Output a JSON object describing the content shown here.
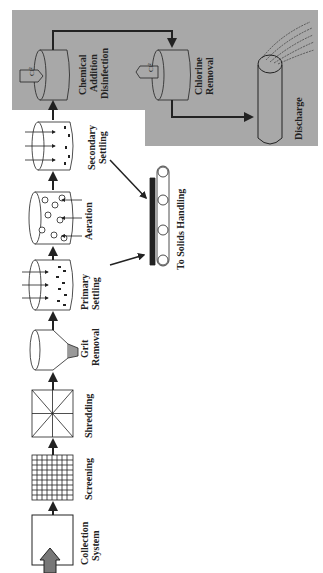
{
  "diagram": {
    "orientation": "rotated-90-ccw",
    "colors": {
      "background": "#ffffff",
      "disinfection_panel": "#a8a8a8",
      "stroke": "#222222"
    },
    "stages": [
      {
        "id": "collection",
        "line1": "Collection",
        "line2": "System"
      },
      {
        "id": "screening",
        "line1": "Screening",
        "line2": ""
      },
      {
        "id": "shredding",
        "line1": "Shredding",
        "line2": ""
      },
      {
        "id": "grit",
        "line1": "Grit",
        "line2": "Removal"
      },
      {
        "id": "primary",
        "line1": "Primary",
        "line2": "Settling"
      },
      {
        "id": "aeration",
        "line1": "Aeration",
        "line2": ""
      },
      {
        "id": "secondary",
        "line1": "Secondary",
        "line2": "Settling"
      },
      {
        "id": "chemical",
        "line1": "Chemical",
        "line2": "Addition",
        "line3": "Disinfection"
      },
      {
        "id": "chlorine",
        "line1": "Chlorine",
        "line2": "Removal"
      },
      {
        "id": "discharge",
        "line1": "Discharge",
        "line2": ""
      }
    ],
    "solids": {
      "label": "To Solids Handling"
    },
    "chemical_tag": "Cl²"
  }
}
